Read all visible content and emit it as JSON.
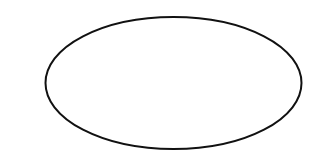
{
  "canvas": {
    "width": 328,
    "height": 161,
    "background": "#ffffff"
  },
  "shapes": [
    {
      "type": "ellipse",
      "cx": 173.5,
      "cy": 83,
      "rx": 128,
      "ry": 66,
      "stroke": "#111111",
      "stroke_width": 2,
      "fill": "none",
      "label": ""
    }
  ]
}
